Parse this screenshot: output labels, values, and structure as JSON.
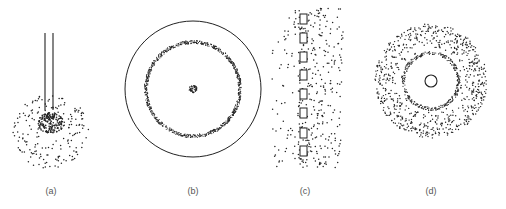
{
  "panels": [
    {
      "id": "a",
      "label": "(a)",
      "label_x": 51,
      "description": "two parallel vertical lines terminating in a dense particle cluster surrounded by a sparse scatter"
    },
    {
      "id": "b",
      "label": "(b)",
      "label_x": 193,
      "description": "large outer circle containing a dense dotted ring and a small central dot cluster"
    },
    {
      "id": "c",
      "label": "(c)",
      "label_x": 305,
      "description": "vertical column of eight small rectangles with particles scattered mostly to the right"
    },
    {
      "id": "d",
      "label": "(d)",
      "label_x": 431,
      "description": "small central circle within a clear zone bounded by a dense ring and a wide sparse annulus of particles"
    }
  ],
  "colors": {
    "ink": "#222222",
    "label": "#555555",
    "background": "#ffffff"
  },
  "geometry": {
    "a": {
      "lines_x": [
        45,
        53
      ],
      "line_top": 33,
      "line_bottom": 110,
      "cluster_center": [
        51,
        126
      ],
      "core_radius": 13,
      "outer_radius": 38
    },
    "b": {
      "center": [
        193,
        89
      ],
      "outer_circle_r": 68,
      "ring_r": 47,
      "core_r": 4
    },
    "c": {
      "square_x": 300,
      "square_w": 7,
      "square_h": 10,
      "square_ys": [
        14,
        33,
        52,
        70,
        89,
        108,
        128,
        146
      ]
    },
    "d": {
      "center": [
        431,
        81
      ],
      "inner_circle_r": 6,
      "ring_r": 26,
      "outer_r": 56
    }
  }
}
